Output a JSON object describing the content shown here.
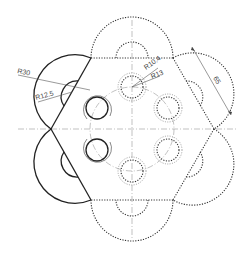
{
  "drawing": {
    "title": "Hexagonal flange with lobes",
    "colors": {
      "solid": "#222222",
      "dotted": "#333333",
      "center": "#999999",
      "text": "#444444"
    },
    "dimensions": {
      "r_outer_lobe": "R30",
      "r_inner_lobe": "R12.5",
      "r_hole_inner": "R10.4",
      "r_hole_outer": "R13",
      "edge_length": "65"
    }
  }
}
